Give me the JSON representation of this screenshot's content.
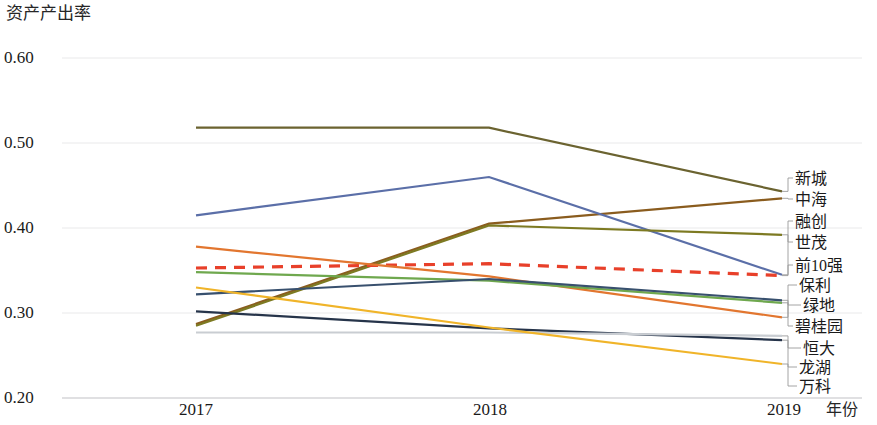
{
  "chart_data": {
    "type": "line",
    "title": "",
    "ylabel": "资产产出率",
    "xlabel": "年份",
    "categories": [
      "2017",
      "2018",
      "2019"
    ],
    "x": [
      2017,
      2018,
      2019
    ],
    "ylim": [
      0.2,
      0.6
    ],
    "yticks": [
      "0.20",
      "0.30",
      "0.40",
      "0.50",
      "0.60"
    ],
    "ytick_values": [
      0.2,
      0.3,
      0.4,
      0.5,
      0.6
    ],
    "grid": true,
    "legend_position": "right",
    "series": [
      {
        "name": "新城",
        "values": [
          0.518,
          0.518,
          0.443
        ],
        "color": "#6b6330",
        "style": "solid"
      },
      {
        "name": "中海",
        "values": [
          0.287,
          0.405,
          0.435
        ],
        "color": "#8a5c1e",
        "style": "solid"
      },
      {
        "name": "融创",
        "values": [
          0.415,
          0.46,
          0.345
        ],
        "color": "#5b6fa8",
        "style": "solid"
      },
      {
        "name": "世茂",
        "values": [
          0.285,
          0.403,
          0.392
        ],
        "color": "#7d7a22",
        "style": "solid"
      },
      {
        "name": "前10强",
        "values": [
          0.353,
          0.358,
          0.344
        ],
        "color": "#e8402a",
        "style": "dashed"
      },
      {
        "name": "保利",
        "values": [
          0.378,
          0.343,
          0.295
        ],
        "color": "#e2762f",
        "style": "solid"
      },
      {
        "name": "绿地",
        "values": [
          0.348,
          0.338,
          0.312
        ],
        "color": "#6fa84e",
        "style": "solid"
      },
      {
        "name": "碧桂园",
        "values": [
          0.322,
          0.34,
          0.315
        ],
        "color": "#38506e",
        "style": "solid"
      },
      {
        "name": "恒大",
        "values": [
          0.302,
          0.282,
          0.268
        ],
        "color": "#26344a",
        "style": "solid"
      },
      {
        "name": "龙湖",
        "values": [
          0.277,
          0.277,
          0.273
        ],
        "color": "#c9cdd2",
        "style": "solid"
      },
      {
        "name": "万科",
        "values": [
          0.33,
          0.283,
          0.24
        ],
        "color": "#f0b429",
        "style": "solid"
      }
    ]
  },
  "axes": {
    "y_title": "资产产出率",
    "x_title": "年份",
    "y_ticks": [
      "0.60",
      "0.50",
      "0.40",
      "0.30",
      "0.20"
    ],
    "x_ticks": [
      "2017",
      "2018",
      "2019"
    ]
  },
  "legend": {
    "items": [
      {
        "label": "新城",
        "color": "#6b6330"
      },
      {
        "label": "中海",
        "color": "#8a5c1e"
      },
      {
        "label": "融创",
        "color": "#5b6fa8"
      },
      {
        "label": "世茂",
        "color": "#7d7a22"
      },
      {
        "label": "前10强",
        "color": "#e8402a"
      },
      {
        "label": "保利",
        "color": "#e2762f"
      },
      {
        "label": "绿地",
        "color": "#6fa84e"
      },
      {
        "label": "碧桂园",
        "color": "#38506e"
      },
      {
        "label": "恒大",
        "color": "#26344a"
      },
      {
        "label": "龙湖",
        "color": "#c9cdd2"
      },
      {
        "label": "万科",
        "color": "#f0b429"
      }
    ]
  }
}
